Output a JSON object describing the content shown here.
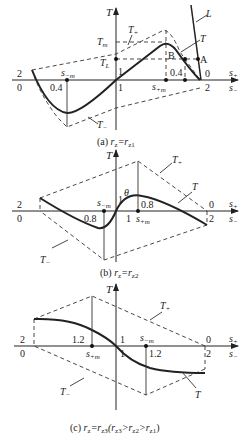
{
  "panels": [
    {
      "id": "a",
      "caption_prefix": "(a) ",
      "caption_r": "r",
      "caption_sub": "z",
      "caption_eq": "=r",
      "caption_sub2": "z1",
      "caption_tail": "",
      "y_axis_label": "T",
      "x_axis_label_top": "s",
      "x_axis_label_top_sub": "+",
      "x_axis_label_bottom": "s",
      "x_axis_label_bottom_sub": "−",
      "left_top_tick": "2",
      "left_bottom_tick": "0",
      "right_top_tick": "0",
      "right_bottom_tick": "2",
      "center_top_tick": "1",
      "center_bottom_tick": "1",
      "left_point_value": "0.4",
      "left_point_label": "s",
      "left_point_sub": "−m",
      "right_point_value": "0.4",
      "right_point_label": "s",
      "right_point_sub": "+m",
      "curves": {
        "upper": "T+",
        "lower": "T−",
        "main": "T",
        "load": "L"
      },
      "labels": {
        "Tm": "T",
        "Tm_sub": "m",
        "TL": "T",
        "TL_sub": "L",
        "Tplus": "T",
        "Tplus_sub": "+",
        "Tminus": "T",
        "Tminus_sub": "−",
        "T_curve": "T",
        "L_curve": "L",
        "A": "A",
        "B": "B"
      }
    },
    {
      "id": "b",
      "caption_prefix": "(b) ",
      "caption_r": "r",
      "caption_sub": "z",
      "caption_eq": "=r",
      "caption_sub2": "z2",
      "caption_tail": "",
      "y_axis_label": "T",
      "x_axis_label_top": "s",
      "x_axis_label_top_sub": "+",
      "x_axis_label_bottom": "s",
      "x_axis_label_bottom_sub": "−",
      "left_top_tick": "2",
      "left_bottom_tick": "0",
      "right_top_tick": "0",
      "right_bottom_tick": "2",
      "center_top_tick": "1",
      "center_bottom_tick": "1",
      "left_point_value": "0.8",
      "left_point_label": "s",
      "left_point_sub": "−m",
      "right_point_value": "0.8",
      "right_point_label": "s",
      "right_point_sub": "+m",
      "theta": "θ",
      "labels": {
        "Tplus": "T",
        "Tplus_sub": "+",
        "Tminus": "T",
        "Tminus_sub": "−",
        "T_curve": "T"
      }
    },
    {
      "id": "c",
      "caption_prefix": "(c) ",
      "caption_r": "r",
      "caption_sub": "z",
      "caption_eq": "=r",
      "caption_sub2": "z3",
      "caption_tail": "(r",
      "caption_tail_parts": [
        "z3",
        ">r",
        "z2",
        ">r",
        "z1",
        ")"
      ],
      "y_axis_label": "T",
      "x_axis_label_top": "s",
      "x_axis_label_top_sub": "+",
      "x_axis_label_bottom": "s",
      "x_axis_label_bottom_sub": "−",
      "left_top_tick": "2",
      "left_bottom_tick": "0",
      "right_top_tick": "0",
      "right_bottom_tick": "2",
      "center_top_tick": "1",
      "center_bottom_tick": "1",
      "left_point_value": "1.2",
      "left_point_label": "s",
      "left_point_sub": "+m",
      "right_point_value": "1.2",
      "right_point_label": "s",
      "right_point_sub": "−m",
      "labels": {
        "Tplus": "T",
        "Tplus_sub": "+",
        "Tminus": "T",
        "Tminus_sub": "−",
        "T_curve": "T"
      }
    }
  ]
}
